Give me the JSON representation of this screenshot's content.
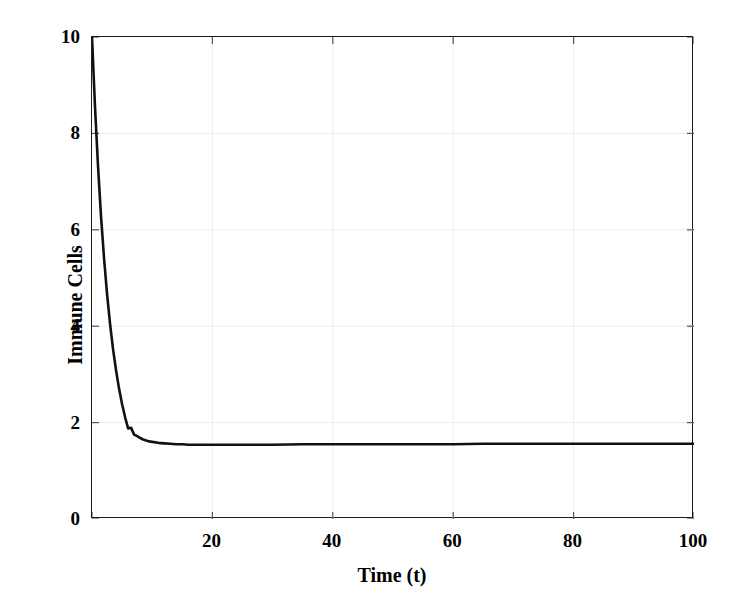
{
  "chart_data": {
    "type": "line",
    "title": "",
    "xlabel": "Time (t)",
    "ylabel": "Immune Cells",
    "xlim": [
      0,
      100
    ],
    "ylim": [
      0,
      10
    ],
    "xticks": [
      0,
      20,
      40,
      60,
      80,
      100
    ],
    "xtick_labels": [
      "0",
      "20",
      "40",
      "60",
      "80",
      "100"
    ],
    "yticks": [
      0,
      2,
      4,
      6,
      8,
      10
    ],
    "ytick_labels": [
      "0",
      "2",
      "4",
      "6",
      "8",
      "10"
    ],
    "grid": true,
    "legend": null,
    "line_color": "#111111",
    "line_width": 2.6,
    "series": [
      {
        "name": "Immune Cells",
        "x": [
          0,
          0.5,
          1,
          1.5,
          2,
          2.5,
          3,
          3.5,
          4,
          4.5,
          5,
          5.5,
          6,
          6.5,
          7,
          7.5,
          8,
          8.5,
          9,
          9.5,
          10,
          11,
          12,
          13,
          14,
          15,
          16,
          17,
          18,
          19,
          20,
          22,
          24,
          26,
          28,
          30,
          35,
          40,
          45,
          50,
          55,
          60,
          65,
          70,
          75,
          80,
          85,
          90,
          95,
          100
        ],
        "y": [
          10.0,
          8.55,
          7.32,
          6.28,
          5.41,
          4.67,
          4.05,
          3.52,
          3.08,
          2.7,
          2.38,
          2.11,
          1.88,
          1.89,
          1.75,
          1.72,
          1.68,
          1.65,
          1.63,
          1.61,
          1.6,
          1.58,
          1.57,
          1.56,
          1.55,
          1.55,
          1.54,
          1.54,
          1.54,
          1.54,
          1.54,
          1.54,
          1.54,
          1.54,
          1.54,
          1.54,
          1.55,
          1.55,
          1.55,
          1.55,
          1.55,
          1.55,
          1.56,
          1.56,
          1.56,
          1.56,
          1.56,
          1.56,
          1.56,
          1.56
        ]
      }
    ],
    "annotations": []
  }
}
